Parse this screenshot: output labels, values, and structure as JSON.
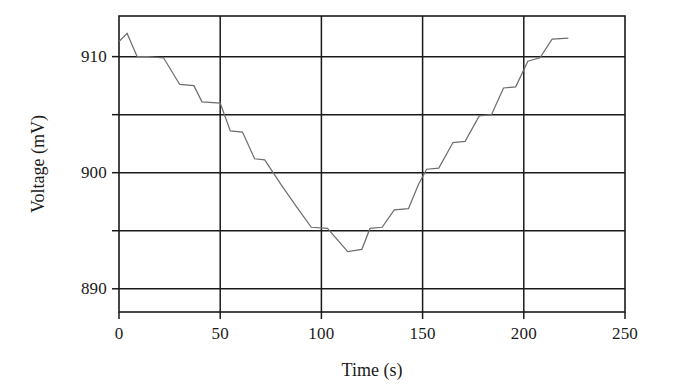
{
  "chart_data": {
    "type": "line",
    "title": "",
    "xlabel": "Time (s)",
    "ylabel": "Voltage (mV)",
    "xlim": [
      0,
      250
    ],
    "ylim": [
      888.0,
      913.5
    ],
    "xticks": [
      0,
      50,
      100,
      150,
      200,
      250
    ],
    "xtick_labels": [
      "0",
      "50",
      "100",
      "150",
      "200",
      "250"
    ],
    "yticks": [
      890,
      900,
      910
    ],
    "ytick_labels": [
      "890",
      "900",
      "910"
    ],
    "yticks_minor": [
      895,
      905
    ],
    "grid": true,
    "grid_axes": "both",
    "legend": null,
    "line_color": "#6e6e6e",
    "frame_color": "#1a1a1a",
    "series": [
      {
        "name": "Voltage",
        "step": "staircase",
        "x": [
          0,
          4,
          4,
          9,
          9,
          14,
          14,
          22,
          22,
          30,
          30,
          37,
          37,
          41,
          41,
          50,
          50,
          55,
          55,
          61,
          61,
          67,
          67,
          72,
          72,
          80,
          80,
          88,
          88,
          95,
          95,
          103,
          103,
          113,
          113,
          120,
          120,
          124,
          124,
          130,
          130,
          136,
          136,
          143,
          143,
          148,
          148,
          152,
          152,
          158,
          158,
          165,
          165,
          171,
          171,
          178,
          178,
          184,
          184,
          190,
          190,
          196,
          196,
          202,
          202,
          208,
          208,
          214,
          214,
          222
        ],
        "y": [
          911.3,
          912.0,
          912.0,
          910.0,
          910.0,
          910.0,
          910.0,
          909.9,
          909.9,
          907.6,
          907.6,
          907.5,
          907.5,
          906.1,
          906.1,
          906.0,
          906.0,
          903.6,
          903.6,
          903.5,
          903.5,
          901.2,
          901.2,
          901.1,
          901.1,
          899.0,
          899.0,
          897.0,
          897.0,
          895.3,
          895.3,
          895.2,
          895.2,
          893.2,
          893.2,
          893.4,
          893.4,
          895.2,
          895.2,
          895.3,
          895.3,
          896.8,
          896.8,
          896.9,
          896.9,
          899.0,
          899.0,
          900.3,
          900.3,
          900.4,
          900.4,
          902.6,
          902.6,
          902.7,
          902.7,
          904.9,
          904.9,
          905.0,
          905.0,
          907.3,
          907.3,
          907.4,
          907.4,
          909.6,
          909.6,
          909.9,
          909.9,
          911.5,
          911.5,
          911.6
        ]
      }
    ]
  },
  "axes": {
    "x_axis_name": "time-axis",
    "y_axis_name": "voltage-axis"
  }
}
